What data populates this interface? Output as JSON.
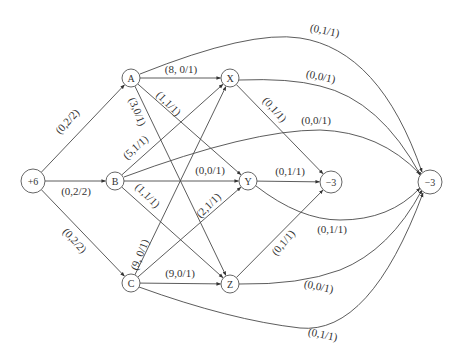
{
  "diagram": {
    "type": "flow-network",
    "nodes": [
      {
        "id": "S",
        "label": "+6",
        "x": 33,
        "y": 181,
        "r": 12
      },
      {
        "id": "A",
        "label": "A",
        "x": 131,
        "y": 78,
        "r": 9
      },
      {
        "id": "B",
        "label": "B",
        "x": 115,
        "y": 181,
        "r": 9
      },
      {
        "id": "C",
        "label": "C",
        "x": 131,
        "y": 283,
        "r": 9
      },
      {
        "id": "X",
        "label": "X",
        "x": 230,
        "y": 78,
        "r": 9
      },
      {
        "id": "Y",
        "label": "Y",
        "x": 248,
        "y": 181,
        "r": 9
      },
      {
        "id": "Z",
        "label": "Z",
        "x": 230,
        "y": 284,
        "r": 9
      },
      {
        "id": "T1",
        "label": "−3",
        "x": 331,
        "y": 182,
        "r": 11
      },
      {
        "id": "T2",
        "label": "−3",
        "x": 430,
        "y": 182,
        "r": 12
      }
    ],
    "edges": [
      {
        "from": "S",
        "to": "A",
        "label": "(0,2/2)",
        "lx": 70,
        "ly": 124,
        "rot": -47
      },
      {
        "from": "S",
        "to": "B",
        "label": "(0,2/2)",
        "lx": 76,
        "ly": 195,
        "rot": 0
      },
      {
        "from": "S",
        "to": "C",
        "label": "(0,2/2)",
        "lx": 72,
        "ly": 243,
        "rot": 47
      },
      {
        "from": "A",
        "to": "X",
        "label": "(8, 0/1)",
        "lx": 181,
        "ly": 73,
        "rot": 0
      },
      {
        "from": "A",
        "to": "Y",
        "label": "(1,1/1)",
        "lx": 166,
        "ly": 106,
        "rot": 45
      },
      {
        "from": "A",
        "to": "Z",
        "label": "(3,0/1)",
        "lx": 134,
        "ly": 113,
        "rot": 68
      },
      {
        "from": "A",
        "to": "T2",
        "label": "(0,1/1)",
        "lx": 324,
        "ly": 34,
        "rot": 12,
        "curve": "M140,74 Q250,30 300,38 Q380,50 422,172"
      },
      {
        "from": "B",
        "to": "X",
        "label": "(5,1/1)",
        "lx": 138,
        "ly": 150,
        "rot": -42
      },
      {
        "from": "B",
        "to": "Y",
        "label": "(0,0/1)",
        "lx": 210,
        "ly": 174,
        "rot": 0
      },
      {
        "from": "B",
        "to": "Z",
        "label": "(1,1/1)",
        "lx": 145,
        "ly": 198,
        "rot": 45
      },
      {
        "from": "B",
        "to": "T2",
        "label": "(0,0/1)",
        "lx": 316,
        "ly": 124,
        "rot": 0,
        "curve": "M124,177 Q250,130 320,130 Q380,132 420,174"
      },
      {
        "from": "C",
        "to": "X",
        "label": "(9, 0/1)",
        "lx": 143,
        "ly": 256,
        "rot": -68
      },
      {
        "from": "C",
        "to": "Y",
        "label": "(2,1/1)",
        "lx": 211,
        "ly": 208,
        "rot": -45
      },
      {
        "from": "C",
        "to": "Z",
        "label": "(9,0/1)",
        "lx": 180,
        "ly": 277,
        "rot": 0
      },
      {
        "from": "C",
        "to": "T2",
        "label": "(0,1/1)",
        "lx": 322,
        "ly": 338,
        "rot": 12,
        "curve": "M139,287 Q230,320 300,328 Q370,335 423,193"
      },
      {
        "from": "X",
        "to": "T1",
        "label": "(0,1/1)",
        "lx": 272,
        "ly": 112,
        "rot": 48
      },
      {
        "from": "X",
        "to": "T2",
        "label": "(0,0/1)",
        "lx": 320,
        "ly": 80,
        "rot": 12,
        "curve": "M239,80 Q290,78 320,86 Q380,100 421,176"
      },
      {
        "from": "Y",
        "to": "T1",
        "label": "(0,1/1)",
        "lx": 290,
        "ly": 175,
        "rot": 0
      },
      {
        "from": "Y",
        "to": "T2",
        "label": "(0,1/1)",
        "lx": 332,
        "ly": 233,
        "rot": 0,
        "curve": "M256,186 Q300,220 340,220 Q390,220 420,188"
      },
      {
        "from": "Z",
        "to": "T1",
        "label": "(0,1/1)",
        "lx": 286,
        "ly": 245,
        "rot": -50
      },
      {
        "from": "Z",
        "to": "T2",
        "label": "(0,0/1)",
        "lx": 318,
        "ly": 290,
        "rot": 12,
        "curve": "M239,284 Q300,285 340,270 Q390,250 422,190"
      }
    ]
  }
}
